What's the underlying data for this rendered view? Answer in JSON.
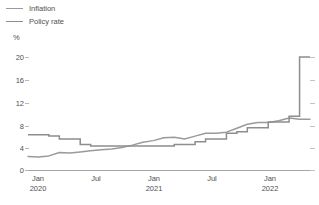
{
  "legend": {
    "items": [
      {
        "label": "Inflation",
        "color": "#9a9a9a",
        "name": "inflation"
      },
      {
        "label": "Policy rate",
        "color": "#8d8d8d",
        "name": "policy-rate"
      }
    ]
  },
  "axis": {
    "unit": "%",
    "y_ticks": [
      "20",
      "16",
      "12",
      "8",
      "4",
      "0"
    ],
    "x_ticks": [
      {
        "top": "Jan",
        "bottom": "2020"
      },
      {
        "top": "Jul",
        "bottom": ""
      },
      {
        "top": "Jan",
        "bottom": "2021"
      },
      {
        "top": "Jul",
        "bottom": ""
      },
      {
        "top": "Jan",
        "bottom": "2022"
      }
    ]
  },
  "chart_data": {
    "type": "line",
    "title": "",
    "xlabel": "",
    "ylabel": "%",
    "ylim": [
      0,
      20
    ],
    "grid": false,
    "legend_position": "top-left",
    "x": [
      "2020-01",
      "2020-02",
      "2020-03",
      "2020-04",
      "2020-05",
      "2020-06",
      "2020-07",
      "2020-08",
      "2020-09",
      "2020-10",
      "2020-11",
      "2020-12",
      "2021-01",
      "2021-02",
      "2021-03",
      "2021-04",
      "2021-05",
      "2021-06",
      "2021-07",
      "2021-08",
      "2021-09",
      "2021-10",
      "2021-11",
      "2021-12",
      "2022-01",
      "2022-02",
      "2022-03",
      "2022-04"
    ],
    "series": [
      {
        "name": "Inflation",
        "color": "#9a9a9a",
        "style": "smooth",
        "values": [
          2.4,
          2.3,
          2.5,
          3.1,
          3.0,
          3.2,
          3.4,
          3.6,
          3.7,
          4.0,
          4.4,
          4.9,
          5.2,
          5.7,
          5.8,
          5.5,
          6.0,
          6.5,
          6.5,
          6.7,
          7.4,
          8.1,
          8.4,
          8.4,
          8.7,
          9.2,
          9.0,
          9.0
        ]
      },
      {
        "name": "Policy rate",
        "color": "#8d8d8d",
        "style": "step",
        "values": [
          6.25,
          6.25,
          6.0,
          5.5,
          5.5,
          4.5,
          4.25,
          4.25,
          4.25,
          4.25,
          4.25,
          4.25,
          4.25,
          4.25,
          4.5,
          4.5,
          5.0,
          5.5,
          5.5,
          6.5,
          6.75,
          7.5,
          7.5,
          8.5,
          8.5,
          9.5,
          20.0,
          20.0
        ]
      }
    ],
    "annotations": [
      {
        "text": "Policy rate spike to 20% in early 2022",
        "x": "2022-03",
        "y": 20
      }
    ]
  }
}
